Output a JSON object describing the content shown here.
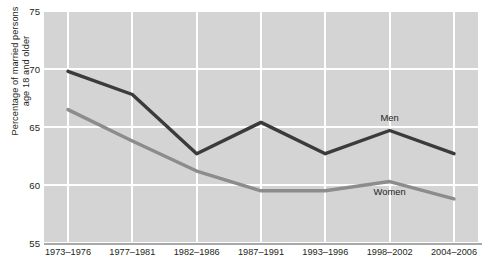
{
  "chart_data": {
    "type": "line",
    "title": "",
    "xlabel": "",
    "ylabel": "Percentage of married persons\nage 18 and older",
    "categories": [
      "1973–1976",
      "1977–1981",
      "1982–1986",
      "1987–1991",
      "1993–1996",
      "1998–2002",
      "2004–2006"
    ],
    "ylim": [
      55,
      75
    ],
    "yticks": [
      55,
      60,
      65,
      70,
      75
    ],
    "ytick_labels": [
      "55",
      "60",
      "65",
      "70",
      "75"
    ],
    "grid": true,
    "legend_position": "inline-annotation",
    "series": [
      {
        "name": "Men",
        "color": "#3b3b3b",
        "values": [
          69.8,
          67.8,
          62.7,
          65.4,
          62.7,
          64.7,
          62.7
        ]
      },
      {
        "name": "Women",
        "color": "#8c8c8c",
        "values": [
          66.5,
          63.8,
          61.2,
          59.5,
          59.5,
          60.3,
          58.8
        ]
      }
    ],
    "annotations": [
      {
        "text": "Men",
        "x_category": "1998–2002",
        "value": 65.9
      },
      {
        "text": "Women",
        "x_category": "1998–2002",
        "value": 59.5
      }
    ],
    "colors": {
      "plot_background": "#d4d4d4",
      "gridline": "#ffffff",
      "axis": "#a8a8a8",
      "text": "#231f20",
      "men_line": "#3b3b3b",
      "women_line": "#8c8c8c"
    }
  }
}
